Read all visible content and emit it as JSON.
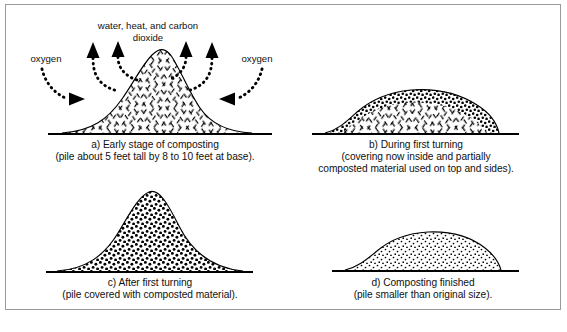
{
  "figure": {
    "title_semantic": "composting-pile-stages-diagram",
    "background_color": "#ffffff",
    "border_color": "#9a9a9a",
    "ink_color": "#000000"
  },
  "panels": {
    "a": {
      "id": "a",
      "caption_line1": "a) Early stage of composting",
      "caption_line2": "(pile about 5 feet tall by 8 to 10 feet at base).",
      "emission_label_line1": "water, heat, and carbon",
      "emission_label_line2": "dioxide",
      "oxygen_label_left": "oxygen",
      "oxygen_label_right": "oxygen",
      "fill_pattern": "dashed-crosshatch",
      "upward_arrow_count": 4,
      "inward_arrow_count": 2
    },
    "b": {
      "id": "b",
      "caption_line1": "b) During first turning",
      "caption_line2": "(covering now inside and partially",
      "caption_line3": "composted material used on top and sides).",
      "fill_pattern": "dashed-crosshatch-with-stipple-crust"
    },
    "c": {
      "id": "c",
      "caption_line1": "c) After first turning",
      "caption_line2": "(pile covered with composted material).",
      "fill_pattern": "dense-stipple"
    },
    "d": {
      "id": "d",
      "caption_line1": "d) Composting finished",
      "caption_line2": "(pile smaller than original size).",
      "fill_pattern": "fine-stipple"
    }
  }
}
